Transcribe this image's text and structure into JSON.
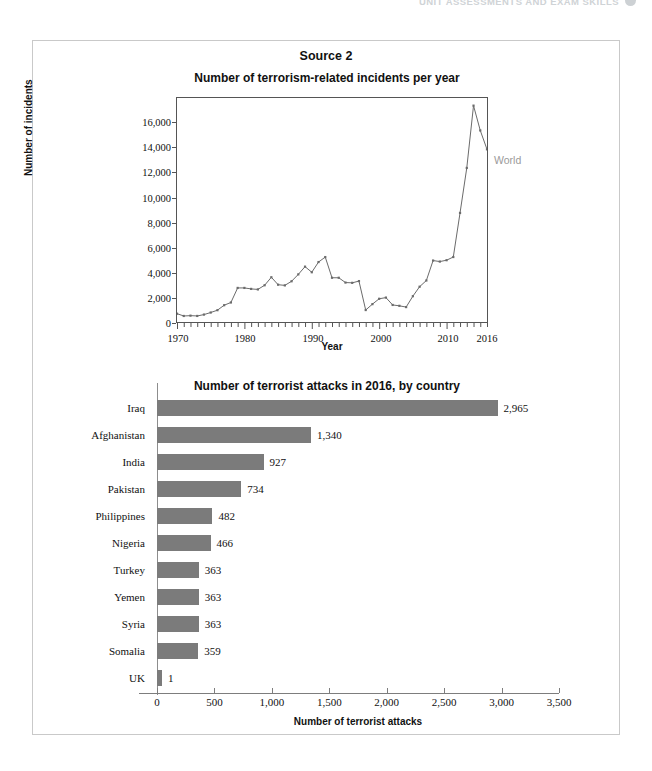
{
  "page_header": {
    "text": "UNIT ASSESSMENTS AND EXAM SKILLS",
    "dot_icon": "filled-circle-icon"
  },
  "card": {
    "source_label": "Source 2"
  },
  "chart_data": [
    {
      "type": "line",
      "title": "Number of terrorism-related incidents per year",
      "xlabel": "Year",
      "ylabel": "Number of incidents",
      "xlim": [
        1970,
        2016
      ],
      "ylim": [
        0,
        17500
      ],
      "grid": false,
      "legend_position": "right-inline",
      "series": [
        {
          "name": "World",
          "color": "#6b6b6b",
          "x": [
            1970,
            1971,
            1972,
            1973,
            1974,
            1975,
            1976,
            1977,
            1978,
            1979,
            1980,
            1981,
            1982,
            1983,
            1984,
            1985,
            1986,
            1987,
            1988,
            1989,
            1990,
            1991,
            1992,
            1993,
            1994,
            1995,
            1996,
            1997,
            1998,
            1999,
            2000,
            2001,
            2002,
            2003,
            2004,
            2005,
            2006,
            2007,
            2008,
            2009,
            2010,
            2011,
            2012,
            2013,
            2014,
            2015,
            2016
          ],
          "values": [
            651,
            471,
            496,
            473,
            580,
            740,
            923,
            1312,
            1526,
            2662,
            2662,
            2585,
            2545,
            2870,
            3495,
            2915,
            2860,
            3182,
            3720,
            4324,
            3887,
            4683,
            5073,
            3456,
            3456,
            3081,
            3059,
            3197,
            934,
            1395,
            1814,
            1906,
            1332,
            1264,
            1166,
            2017,
            2758,
            3242,
            4801,
            4721,
            4827,
            5076,
            8522,
            12036,
            16903,
            14965,
            13488
          ]
        }
      ]
    },
    {
      "type": "bar",
      "orientation": "horizontal",
      "title": "Number of terrorist attacks in 2016, by country",
      "xlabel": "Number of terrorist attacks",
      "ylabel": "",
      "xlim": [
        0,
        3500
      ],
      "xticks": [
        "0",
        "500",
        "1,000",
        "1,500",
        "2,000",
        "2,500",
        "3,000",
        "3,500"
      ],
      "xtick_values": [
        0,
        500,
        1000,
        1500,
        2000,
        2500,
        3000,
        3500
      ],
      "bar_color": "#7b7b7b",
      "categories": [
        "Iraq",
        "Afghanistan",
        "India",
        "Pakistan",
        "Philippines",
        "Nigeria",
        "Turkey",
        "Yemen",
        "Syria",
        "Somalia",
        "UK"
      ],
      "values": [
        2965,
        1340,
        927,
        734,
        482,
        466,
        363,
        363,
        363,
        359,
        1
      ],
      "value_labels": [
        "2,965",
        "1,340",
        "927",
        "734",
        "482",
        "466",
        "363",
        "363",
        "363",
        "359",
        "1"
      ]
    }
  ]
}
